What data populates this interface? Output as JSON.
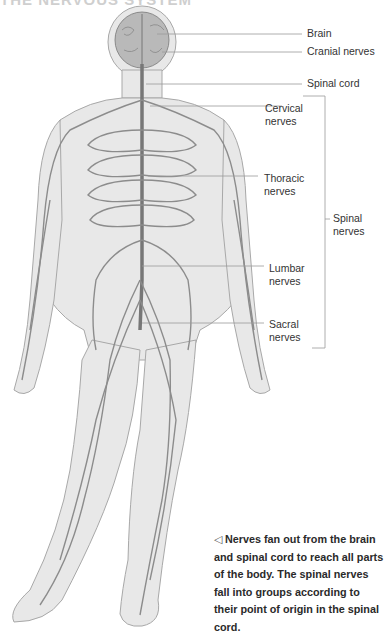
{
  "heading": "THE NERVOUS SYSTEM",
  "labels": {
    "brain": "Brain",
    "cranial_nerves": "Cranial nerves",
    "spinal_cord": "Spinal cord",
    "cervical_nerves": "Cervical\nnerves",
    "thoracic_nerves": "Thoracic\nnerves",
    "lumbar_nerves": "Lumbar\nnerves",
    "sacral_nerves": "Sacral\nnerves",
    "spinal_nerves": "Spinal\nnerves"
  },
  "caption": {
    "icon": "left-triangle-icon",
    "text": "Nerves fan out from the brain and spinal cord to reach all parts of the body. The spinal nerves fall into groups according to their point of origin in the spinal cord."
  },
  "colors": {
    "body_fill": "#e6e6e6",
    "nerve": "#8a8a8a",
    "leader_line": "#9a9a9a",
    "text": "#333333"
  }
}
